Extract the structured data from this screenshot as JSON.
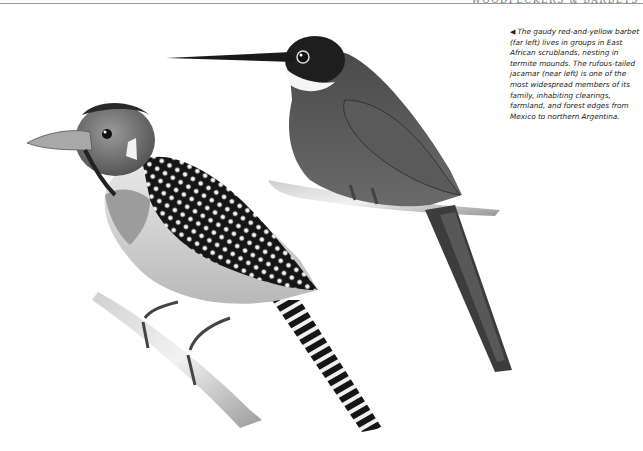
{
  "page": {
    "running_head": "WOODPECKERS & BARBETS",
    "caption": {
      "pointer_icon": "◀",
      "text": "The gaudy red-and-yellow barbet (far left) lives in groups in East African scrublands, nesting in termite mounds. The rufous-tailed jacamar (near left) is one of the most widespread members of its family, inhabiting clearings, farmland, and forest edges from Mexico to northern Argentina."
    },
    "illustration": {
      "subjects": [
        "red-and-yellow barbet",
        "rufous-tailed jacamar"
      ]
    }
  }
}
